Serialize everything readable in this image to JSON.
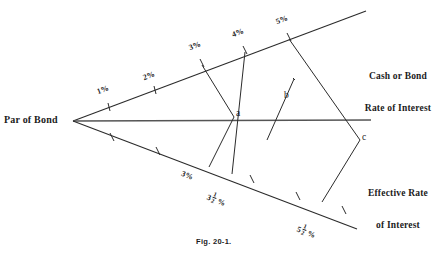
{
  "figure": {
    "caption": "Fig. 20-1.",
    "vertex_label": "Par of Bond",
    "upper_axis_label_line1": "Cash or Bond",
    "upper_axis_label_line2": "Rate of Interest",
    "lower_axis_label_line1": "Effective Rate",
    "lower_axis_label_line2": "of Interest",
    "line_color": "#2b2b2b",
    "background_color": "#ffffff"
  },
  "upper_axis": {
    "name": "Cash or Bond Rate of Interest",
    "ticks": [
      {
        "label": "1%",
        "x": 108,
        "y": 107
      },
      {
        "label": "2%",
        "x": 154,
        "y": 93
      },
      {
        "label": "3%",
        "x": 202,
        "y": 63
      },
      {
        "label": "4%",
        "x": 245,
        "y": 50
      },
      {
        "label": "5%",
        "x": 289,
        "y": 37
      }
    ]
  },
  "lower_axis": {
    "name": "Effective Rate of Interest",
    "ticks": [
      {
        "label": "",
        "x": 112,
        "y": 137
      },
      {
        "label": "",
        "x": 158,
        "y": 151
      },
      {
        "label": "3%",
        "x": 205,
        "y": 165
      },
      {
        "label": "3 1/2 %",
        "whole": "3",
        "num": "1",
        "den": "2",
        "suffix": "%",
        "x": 228,
        "y": 172
      },
      {
        "label": "",
        "x": 272,
        "y": 186
      },
      {
        "label": "5 1/2 %",
        "whole": "5",
        "num": "1",
        "den": "2",
        "suffix": "%",
        "x": 318,
        "y": 200
      },
      {
        "label": "",
        "x": 340,
        "y": 207
      }
    ]
  },
  "points": [
    {
      "label": "a",
      "x": 234,
      "y": 117
    },
    {
      "label": "b",
      "x": 281,
      "y": 99
    },
    {
      "label": "c",
      "x": 360,
      "y": 140
    }
  ]
}
